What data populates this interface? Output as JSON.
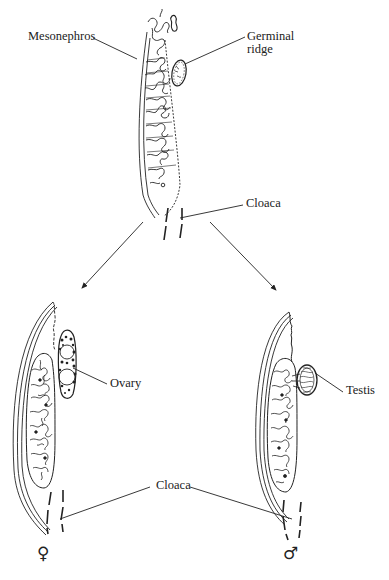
{
  "figure": {
    "labels": {
      "mesonephros": "Mesonephros",
      "germinal_ridge_line1": "Germinal",
      "germinal_ridge_line2": "ridge",
      "cloaca_top": "Cloaca",
      "ovary": "Ovary",
      "testis": "Testis",
      "cloaca_bottom": "Cloaca"
    },
    "symbols": {
      "female": "♀",
      "male": "♂"
    },
    "colors": {
      "ink": "#222222",
      "background": "#ffffff"
    },
    "panels": [
      {
        "name": "indifferent-stage",
        "structures": [
          "mesonephros",
          "germinal ridge",
          "cloaca"
        ]
      },
      {
        "name": "female",
        "structures": [
          "ovary",
          "cloaca"
        ]
      },
      {
        "name": "male",
        "structures": [
          "testis",
          "cloaca"
        ]
      }
    ]
  }
}
